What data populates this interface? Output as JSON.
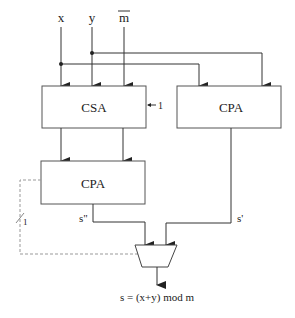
{
  "diagram": {
    "inputs": {
      "x": "x",
      "y": "y",
      "m_bar": "m"
    },
    "blocks": {
      "csa": "CSA",
      "cpa_left": "CPA",
      "cpa_right": "CPA"
    },
    "carry_in_label": "1",
    "signals": {
      "s_double_prime": "s\"",
      "s_prime": "s'",
      "select_width": "1"
    },
    "output_label": "s = (x+y) mod m",
    "colors": {
      "line": "#333333",
      "dashed": "#999999",
      "text": "#222222"
    }
  }
}
